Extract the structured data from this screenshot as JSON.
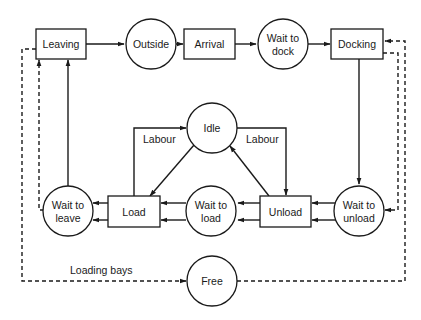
{
  "diagram": {
    "colors": {
      "line": "#1a1a1a",
      "background": "#ffffff"
    },
    "nodes": {
      "leaving": {
        "label": "Leaving",
        "shape": "rect"
      },
      "outside": {
        "label": "Outside",
        "shape": "circle"
      },
      "arrival": {
        "label": "Arrival",
        "shape": "rect"
      },
      "wait_to_dock": {
        "line1": "Wait to",
        "line2": "dock",
        "shape": "circle"
      },
      "docking": {
        "label": "Docking",
        "shape": "rect"
      },
      "idle": {
        "label": "Idle",
        "shape": "circle"
      },
      "load": {
        "label": "Load",
        "shape": "rect"
      },
      "wait_to_load": {
        "line1": "Wait to",
        "line2": "load",
        "shape": "circle"
      },
      "unload": {
        "label": "Unload",
        "shape": "rect"
      },
      "wait_to_leave": {
        "line1": "Wait to",
        "line2": "leave",
        "shape": "circle"
      },
      "wait_to_unload": {
        "line1": "Wait to",
        "line2": "unload",
        "shape": "circle"
      },
      "free": {
        "label": "Free",
        "shape": "circle"
      }
    },
    "edge_labels": {
      "labour_left": "Labour",
      "labour_right": "Labour",
      "loading_bays": "Loading bays"
    },
    "edges": [
      {
        "from": "Leaving",
        "to": "Outside",
        "style": "solid"
      },
      {
        "from": "Outside",
        "to": "Arrival",
        "style": "solid"
      },
      {
        "from": "Arrival",
        "to": "Wait to dock",
        "style": "solid"
      },
      {
        "from": "Wait to dock",
        "to": "Docking",
        "style": "solid"
      },
      {
        "from": "Docking",
        "to": "Wait to unload",
        "style": "solid"
      },
      {
        "from": "Wait to unload",
        "to": "Unload",
        "style": "solid",
        "double": true
      },
      {
        "from": "Unload",
        "to": "Wait to load",
        "style": "solid",
        "double": true
      },
      {
        "from": "Wait to load",
        "to": "Load",
        "style": "solid",
        "double": true
      },
      {
        "from": "Load",
        "to": "Wait to leave",
        "style": "solid",
        "double": true
      },
      {
        "from": "Wait to leave",
        "to": "Leaving",
        "style": "solid"
      },
      {
        "from": "Idle",
        "to": "Load",
        "style": "solid"
      },
      {
        "from": "Load",
        "to": "Idle",
        "style": "solid",
        "label": "Labour"
      },
      {
        "from": "Idle",
        "to": "Unload",
        "style": "solid",
        "label": "Labour"
      },
      {
        "from": "Unload",
        "to": "Idle",
        "style": "solid"
      },
      {
        "from": "Leaving",
        "to": "Free",
        "style": "dashed",
        "label": "Loading bays"
      },
      {
        "from": "Free",
        "to": "Docking",
        "style": "dashed"
      },
      {
        "from": "Docking",
        "to": "Wait to unload",
        "style": "dashed"
      },
      {
        "from": "Wait to leave",
        "to": "Leaving",
        "style": "dashed"
      }
    ]
  }
}
